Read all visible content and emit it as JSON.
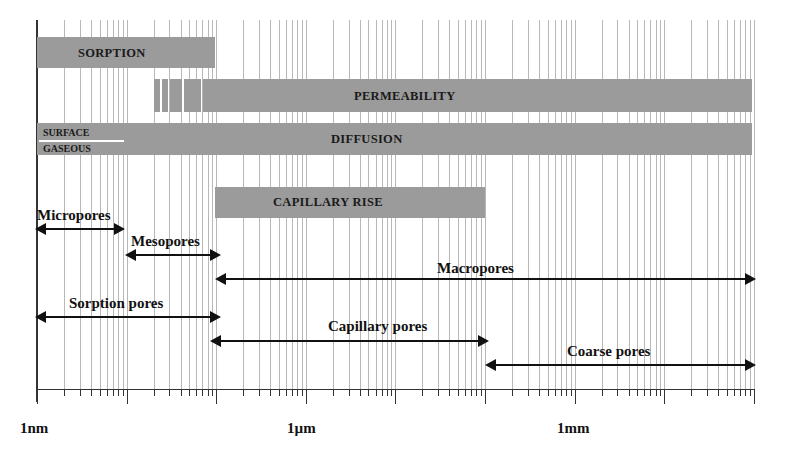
{
  "axis": {
    "scale": "log10",
    "unit": "m",
    "start_label": "1nm",
    "decades": 8,
    "labels": [
      {
        "text": "1nm",
        "decade": 0
      },
      {
        "text": "1µm",
        "decade": 3
      },
      {
        "text": "1mm",
        "decade": 6
      }
    ]
  },
  "mechanisms": [
    {
      "label": "SORPTION",
      "from": "1nm",
      "to": "100nm"
    },
    {
      "label": "PERMEABILITY",
      "from": "~20nm (dashed onset)",
      "to": "100mm"
    },
    {
      "label": "DIFFUSION",
      "from": "1nm",
      "to": "100mm",
      "sublabels": [
        "SURFACE",
        "GASEOUS"
      ]
    },
    {
      "label": "CAPILLARY RISE",
      "from": "100nm",
      "to": "100µm"
    }
  ],
  "pore_classes": [
    {
      "label": "Micropores",
      "from": "1nm",
      "to": "10nm"
    },
    {
      "label": "Mesopores",
      "from": "10nm",
      "to": "100nm"
    },
    {
      "label": "Macropores",
      "from": "100nm",
      "to": "100mm"
    },
    {
      "label": "Sorption pores",
      "from": "1nm",
      "to": "100nm"
    },
    {
      "label": "Capillary pores",
      "from": "100nm",
      "to": "100µm"
    },
    {
      "label": "Coarse pores",
      "from": "100µm",
      "to": "100mm"
    }
  ],
  "colors": {
    "bar": "#9b9b9b",
    "grid": "#b8b8b8",
    "ink": "#111111"
  }
}
